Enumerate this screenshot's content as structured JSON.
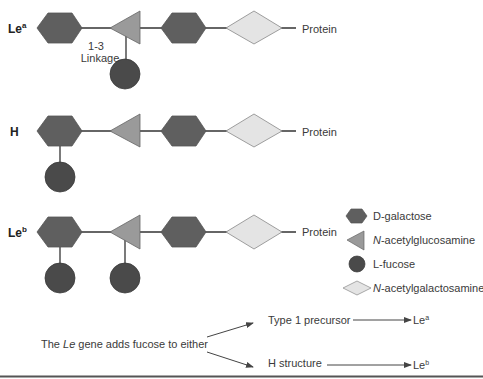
{
  "colors": {
    "galactose": "#5f5f5f",
    "glucosamine": "#9a9a9a",
    "fucose": "#4a4a4a",
    "galactosamine": "#e4e4e4",
    "outline": "#777777",
    "line": "#333333"
  },
  "rows": [
    {
      "id": "lea",
      "label": "Le",
      "sup": "a",
      "protein": "Protein",
      "linkage_line1": "1-3",
      "linkage_line2": "Linkage"
    },
    {
      "id": "h",
      "label": "H",
      "sup": "",
      "protein": "Protein"
    },
    {
      "id": "leb",
      "label": "Le",
      "sup": "b",
      "protein": "Protein"
    }
  ],
  "legend": [
    {
      "shape": "hexagon",
      "label": "D-galactose",
      "italic_prefix": ""
    },
    {
      "shape": "triangle",
      "label": "-acetylglucosamine",
      "italic_prefix": "N"
    },
    {
      "shape": "circle",
      "label": "L-fucose",
      "italic_prefix": ""
    },
    {
      "shape": "diamond",
      "label": "-acetylgalactosamine",
      "italic_prefix": "N"
    }
  ],
  "pathway": {
    "text_pre": "The ",
    "text_italic": "Le",
    "text_post": " gene adds fucose to either",
    "branch_top": "Type 1 precursor",
    "branch_bottom": "H structure",
    "result_top_base": "Le",
    "result_top_sup": "a",
    "result_bottom_base": "Le",
    "result_bottom_sup": "b"
  }
}
